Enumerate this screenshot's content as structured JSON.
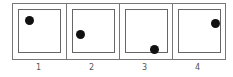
{
  "figure": {
    "panels": [
      {
        "label": "1",
        "dot": {
          "x": 6,
          "y": 6
        }
      },
      {
        "label": "2",
        "dot": {
          "x": 3,
          "y": 20
        }
      },
      {
        "label": "3",
        "dot": {
          "x": 24,
          "y": 35
        }
      },
      {
        "label": "4",
        "dot": {
          "x": 32,
          "y": 9
        }
      }
    ],
    "colors": {
      "border": "#777777",
      "dot": "#111111",
      "label": "#555555"
    }
  }
}
